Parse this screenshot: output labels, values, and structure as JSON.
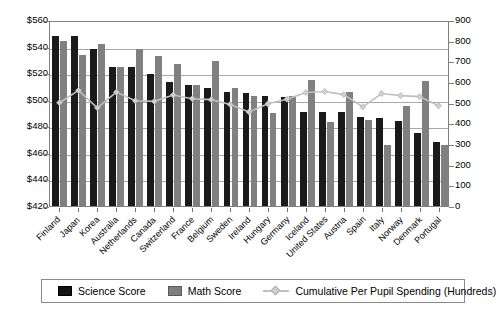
{
  "chart_data": {
    "type": "bar",
    "title": "",
    "subtitle": "",
    "xlabel": "",
    "ylabel": "",
    "y2label": "",
    "ylim": [
      420,
      560
    ],
    "y2lim": [
      0,
      900
    ],
    "grid": true,
    "legend_position": "bottom",
    "y_ticks": [
      "$420",
      "$440",
      "$460",
      "$480",
      "$500",
      "$520",
      "$540",
      "$560"
    ],
    "y2_ticks": [
      "0",
      "100",
      "200",
      "300",
      "400",
      "500",
      "600",
      "700",
      "800",
      "900"
    ],
    "categories": [
      "Finland",
      "Japan",
      "Korea",
      "Australia",
      "Netherlands",
      "Canada",
      "Switzerland",
      "France",
      "Belgium",
      "Sweden",
      "Ireland",
      "Hungary",
      "Germany",
      "Iceland",
      "United States",
      "Austria",
      "Spain",
      "Italy",
      "Norway",
      "Denmark",
      "Portugal"
    ],
    "series": [
      {
        "name": "Science Score",
        "type": "bar",
        "color": "#1a1a1a",
        "axis": "left",
        "values": [
          548,
          548,
          538,
          525,
          525,
          519,
          513,
          511,
          509,
          506,
          505,
          503,
          502,
          491,
          491,
          491,
          487,
          486,
          484,
          475,
          468
        ]
      },
      {
        "name": "Math Score",
        "type": "bar",
        "color": "#808080",
        "axis": "left",
        "values": [
          544,
          534,
          542,
          525,
          538,
          533,
          527,
          511,
          529,
          509,
          503,
          490,
          503,
          515,
          483,
          506,
          485,
          466,
          495,
          514,
          466
        ]
      },
      {
        "name": "Cumulative Per Pupil Spending (Hundreds)",
        "type": "line",
        "color": "#c0c0c0",
        "axis": "right",
        "values": [
          505,
          565,
          480,
          557,
          515,
          512,
          543,
          525,
          520,
          497,
          460,
          500,
          522,
          555,
          560,
          545,
          485,
          550,
          540,
          535,
          490
        ]
      }
    ]
  },
  "legend": {
    "items": [
      {
        "label": "Science Score",
        "marker": "square-dark-icon"
      },
      {
        "label": "Math Score",
        "marker": "square-gray-icon"
      },
      {
        "label": "Cumulative Per Pupil Spending (Hundreds)",
        "marker": "line-diamond-icon"
      }
    ]
  },
  "colors": {
    "science": "#1a1a1a",
    "math": "#808080",
    "spending_line": "#c0c0c0",
    "grid": "#a8a8a8",
    "frame": "#808080",
    "text": "#000000",
    "background": "#ffffff"
  }
}
